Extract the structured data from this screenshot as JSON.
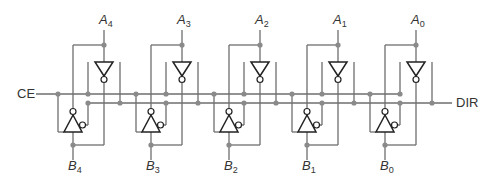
{
  "diagram": {
    "type": "bidirectional tri-state bus transceiver",
    "inputs": {
      "ce_label": "CE",
      "dir_label": "DIR"
    },
    "stages": [
      {
        "a_label": "A",
        "a_sub": "4",
        "b_label": "B",
        "b_sub": "4"
      },
      {
        "a_label": "A",
        "a_sub": "3",
        "b_label": "B",
        "b_sub": "3"
      },
      {
        "a_label": "A",
        "a_sub": "2",
        "b_label": "B",
        "b_sub": "2"
      },
      {
        "a_label": "A",
        "a_sub": "1",
        "b_label": "B",
        "b_sub": "1"
      },
      {
        "a_label": "A",
        "a_sub": "0",
        "b_label": "B",
        "b_sub": "0"
      }
    ],
    "colors": {
      "wire": "#6e6e6e",
      "gate": "#222222",
      "junction": "#8a8a8a",
      "background": "#ffffff"
    }
  }
}
